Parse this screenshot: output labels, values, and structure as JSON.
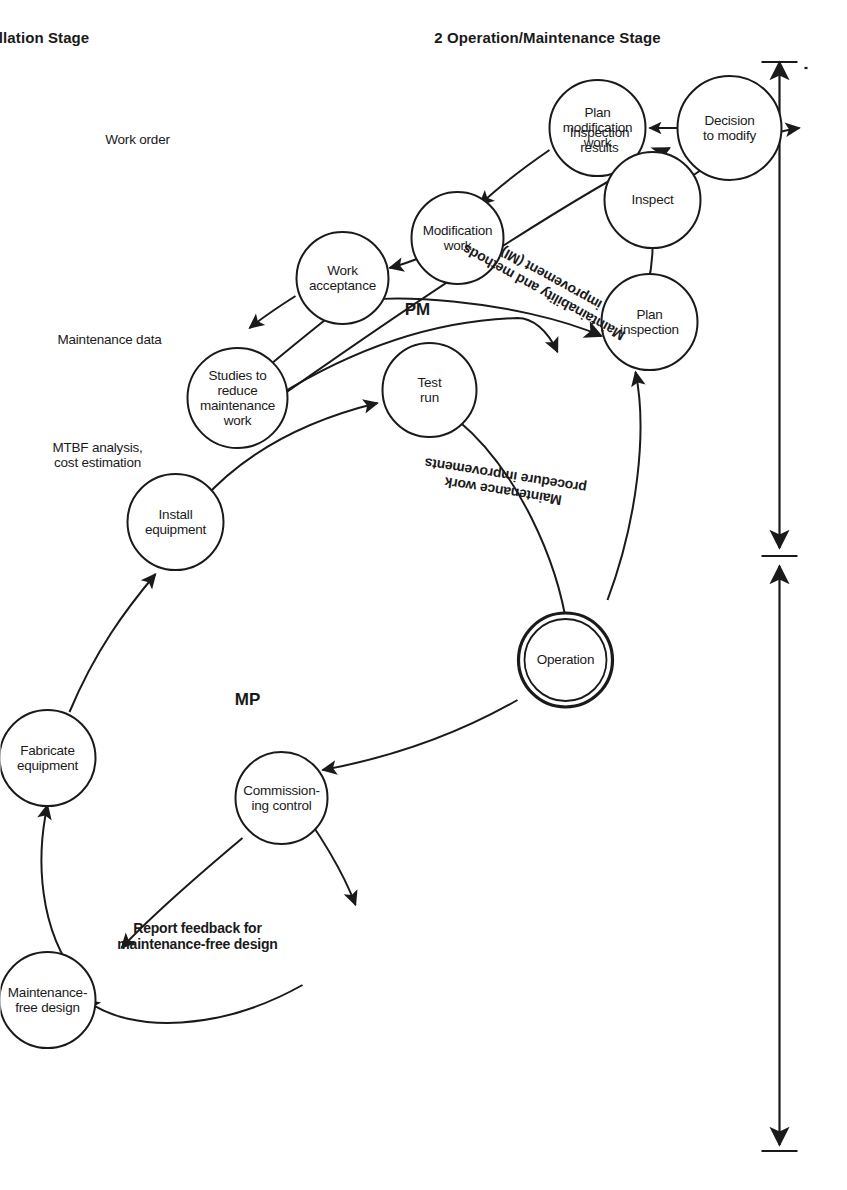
{
  "figure": {
    "title_absent": true,
    "type": "process-flow-diagram",
    "orientation": "rotated-90-clockwise",
    "stages": [
      {
        "id": "stage1",
        "label": "1  Design/Installation Stage",
        "number": "1",
        "name": "Design/Installation Stage"
      },
      {
        "id": "stage2",
        "label": "2  Operation/Maintenance Stage",
        "number": "2",
        "name": "Operation/Maintenance Stage"
      }
    ],
    "zones": [
      {
        "id": "zone-mp",
        "label": "MP"
      },
      {
        "id": "zone-pm",
        "label": "PM"
      }
    ],
    "nodes": [
      {
        "id": "maintenance-free-design",
        "label": "Maintenance-\nfree design",
        "double": false
      },
      {
        "id": "fabricate-equipment",
        "label": "Fabricate\nequipment",
        "double": false
      },
      {
        "id": "install-equipment",
        "label": "Install\nequipment",
        "double": false
      },
      {
        "id": "test-run",
        "label": "Test\nrun",
        "double": false
      },
      {
        "id": "commissioning-control",
        "label": "Commission-\ning control",
        "double": false
      },
      {
        "id": "operation",
        "label": "Operation",
        "double": true
      },
      {
        "id": "plan-inspection",
        "label": "Plan\ninspection",
        "double": false
      },
      {
        "id": "inspect",
        "label": "Inspect",
        "double": false
      },
      {
        "id": "decision-to-modify",
        "label": "Decision\nto modify",
        "double": false
      },
      {
        "id": "plan-modification-work",
        "label": "Plan\nmodification\nwork",
        "double": false
      },
      {
        "id": "modification-work",
        "label": "Modification\nwork",
        "double": false
      },
      {
        "id": "work-acceptance",
        "label": "Work\nacceptance",
        "double": false
      },
      {
        "id": "studies-to-reduce-maintenance-work",
        "label": "Studies to\nreduce\nmaintenance\nwork",
        "double": false
      }
    ],
    "edge_labels": [
      {
        "id": "inspection-results",
        "label": "Inspection\nresults",
        "bold": false
      },
      {
        "id": "work-order",
        "label": "Work order",
        "bold": false
      },
      {
        "id": "maintenance-data",
        "label": "Maintenance data",
        "bold": false
      },
      {
        "id": "mtbf-analysis-cost-estimation",
        "label": "MTBF analysis,\ncost estimation",
        "bold": false
      },
      {
        "id": "maintainability-methods-improvement",
        "label": "Maintainability and methods\nimprovement (MI)",
        "bold": true
      },
      {
        "id": "maintenance-work-procedure-improvements",
        "label": "Maintenance work\nprocedure improvements",
        "bold": true
      },
      {
        "id": "report-feedback-maintenance-free-design",
        "label": "Report feedback for\nmaintenance-free design",
        "bold": true
      }
    ],
    "colors": {
      "ink": "#1a1a1a",
      "background": "#ffffff"
    }
  }
}
